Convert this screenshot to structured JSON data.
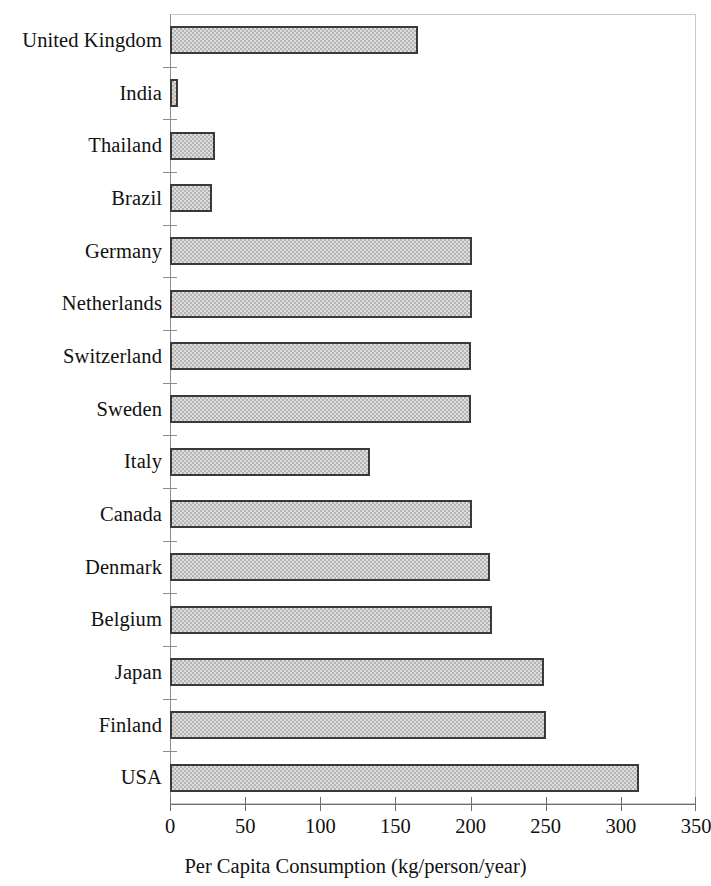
{
  "chart_data": {
    "type": "bar",
    "orientation": "horizontal",
    "title": "",
    "xlabel": "Per Capita Consumption (kg/person/year)",
    "ylabel": "",
    "xlim": [
      0,
      350
    ],
    "xticks": [
      0,
      50,
      100,
      150,
      200,
      250,
      300,
      350
    ],
    "xtick_labels": [
      "0",
      "50",
      "100",
      "150",
      "200",
      "250",
      "300",
      "350"
    ],
    "grid": false,
    "legend": null,
    "categories": [
      "United Kingdom",
      "India",
      "Thailand",
      "Brazil",
      "Germany",
      "Netherlands",
      "Switzerland",
      "Sweden",
      "Italy",
      "Canada",
      "Denmark",
      "Belgium",
      "Japan",
      "Finland",
      "USA"
    ],
    "values": [
      165,
      5,
      30,
      28,
      201,
      201,
      200,
      200,
      133,
      201,
      213,
      214,
      249,
      250,
      312
    ],
    "bar_fill_color": "#b4b4b4",
    "bar_border_color": "#3a3a3a",
    "axis_color": "#6f6f6f",
    "background_color": "#ffffff"
  }
}
